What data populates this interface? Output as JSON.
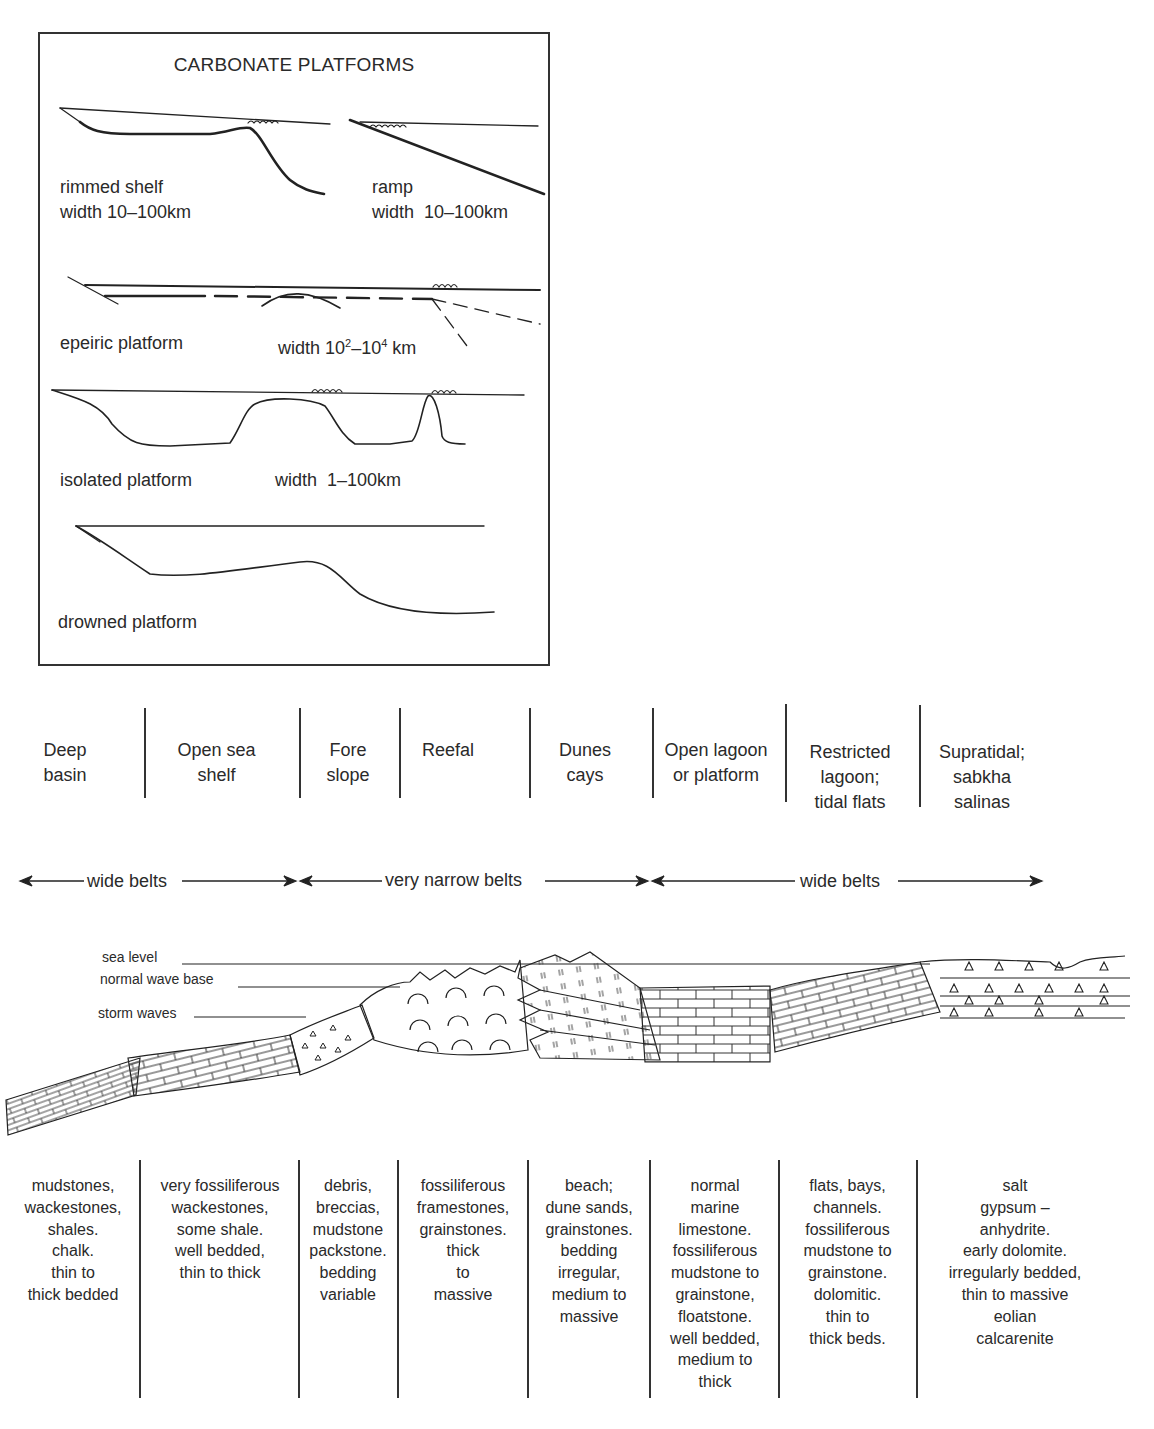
{
  "inset": {
    "title": "CARBONATE PLATFORMS",
    "platforms": [
      {
        "name": "rimmed shelf",
        "width": "width 10–100km"
      },
      {
        "name": "ramp",
        "width": "width  10–100km"
      },
      {
        "name": "epeiric platform",
        "width_prefix": "width 10",
        "width_sup1": "2",
        "width_mid": "–10",
        "width_sup2": "4",
        "width_suffix": " km"
      },
      {
        "name": "isolated platform",
        "width": "width  1–100km"
      },
      {
        "name": "drowned platform"
      }
    ]
  },
  "zones": [
    {
      "label_lines": [
        "Deep",
        "basin"
      ]
    },
    {
      "label_lines": [
        "Open sea",
        "shelf"
      ]
    },
    {
      "label_lines": [
        "Fore",
        "slope"
      ]
    },
    {
      "label_lines": [
        "Reefal"
      ]
    },
    {
      "label_lines": [
        "Dunes",
        "cays"
      ]
    },
    {
      "label_lines": [
        "Open lagoon",
        "or platform"
      ]
    },
    {
      "label_lines": [
        "Restricted",
        "lagoon;",
        "tidal flats"
      ]
    },
    {
      "label_lines": [
        "Supratidal;",
        "sabkha",
        "salinas"
      ]
    }
  ],
  "belts": [
    {
      "label": "wide belts"
    },
    {
      "label": "very narrow belts"
    },
    {
      "label": "wide belts"
    }
  ],
  "profile_labels": {
    "sea_level": "sea level",
    "normal_wave_base": "normal wave base",
    "storm_waves": "storm waves"
  },
  "descriptions": [
    {
      "lines": [
        "mudstones,",
        "wackestones,",
        "shales.",
        "chalk.",
        "thin to",
        "thick bedded"
      ]
    },
    {
      "lines": [
        "very fossiliferous",
        "wackestones,",
        "some shale.",
        "well bedded,",
        "thin to thick"
      ]
    },
    {
      "lines": [
        "debris,",
        "breccias,",
        "mudstone",
        "packstone.",
        "bedding",
        "variable"
      ]
    },
    {
      "lines": [
        "fossiliferous",
        "framestones,",
        "grainstones.",
        "thick",
        "to",
        "massive"
      ]
    },
    {
      "lines": [
        "beach;",
        "dune sands,",
        "grainstones.",
        "bedding",
        "irregular,",
        "medium to",
        "massive"
      ]
    },
    {
      "lines": [
        "normal",
        "marine",
        "limestone.",
        "fossiliferous",
        "mudstone to",
        "grainstone,",
        "floatstone.",
        "well bedded,",
        "medium to",
        "thick"
      ]
    },
    {
      "lines": [
        "flats, bays,",
        "channels.",
        "fossiliferous",
        "mudstone to",
        "grainstone.",
        "dolomitic.",
        "thin to",
        "thick beds."
      ]
    },
    {
      "lines": [
        "salt",
        "gypsum –",
        "anhydrite.",
        "early dolomite.",
        "irregularly bedded,",
        "thin to massive",
        "eolian",
        "calcarenite"
      ]
    }
  ]
}
